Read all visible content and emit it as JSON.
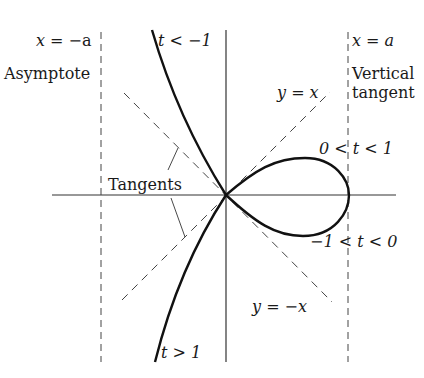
{
  "figure": {
    "labels": {
      "left_asymptote_eq": "x = −a",
      "left_asymptote_name": "Asymptote",
      "right_line_eq": "x = a",
      "right_line_name_1": "Vertical",
      "right_line_name_2": "tangent",
      "upper_branch": "t < −1",
      "lower_branch": "t > 1",
      "loop_upper": "0 < t < 1",
      "loop_lower": "−1 < t < 0",
      "diag_pos": "y = x",
      "diag_neg": "y = −x",
      "tangents": "Tangents"
    },
    "colors": {
      "ink": "#1a1a1a",
      "dash": "#444444",
      "axis": "#333333"
    }
  }
}
